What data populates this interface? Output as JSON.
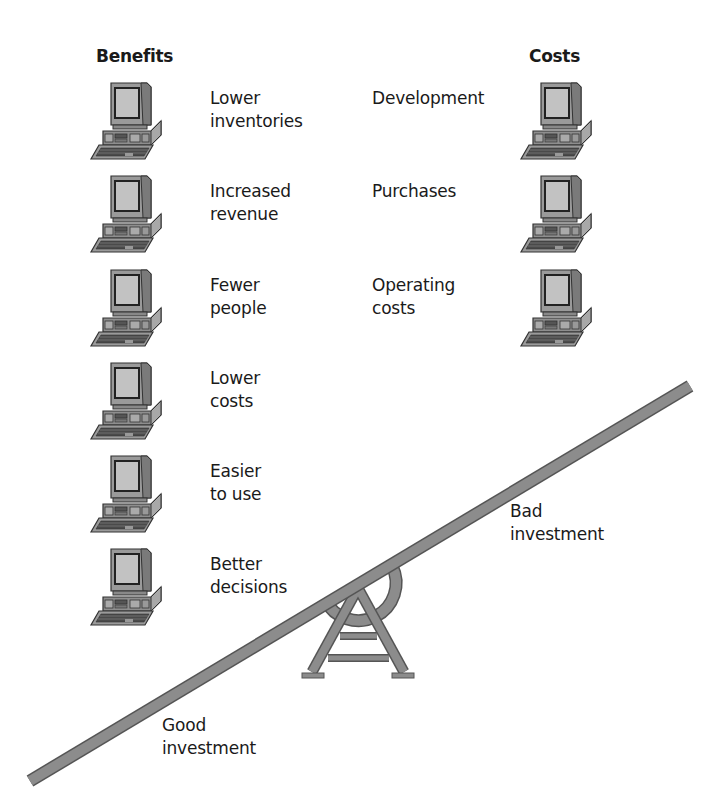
{
  "headings": {
    "benefits": "Benefits",
    "costs": "Costs"
  },
  "benefits": [
    {
      "label": "Lower\ninventories",
      "icon": "computer-icon"
    },
    {
      "label": "Increased\nrevenue",
      "icon": "computer-icon"
    },
    {
      "label": "Fewer\npeople",
      "icon": "computer-icon"
    },
    {
      "label": "Lower\ncosts",
      "icon": "computer-icon"
    },
    {
      "label": "Easier\nto use",
      "icon": "computer-icon"
    },
    {
      "label": "Better\ndecisions",
      "icon": "computer-icon"
    }
  ],
  "costs": [
    {
      "label": "Development",
      "icon": "computer-icon"
    },
    {
      "label": "Purchases",
      "icon": "computer-icon"
    },
    {
      "label": "Operating\ncosts",
      "icon": "computer-icon"
    }
  ],
  "seesaw": {
    "high_end_label": "Bad\ninvestment",
    "low_end_label": "Good\ninvestment",
    "beam_color": "#8c8c8c",
    "outline_color": "#555555"
  }
}
